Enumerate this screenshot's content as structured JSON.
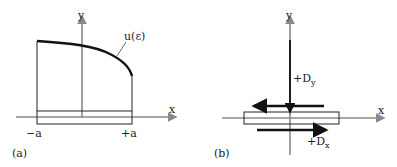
{
  "panel_a": {
    "caption": "(a)",
    "y_axis_label": "y",
    "x_axis_label": "x",
    "curve_label": "u(ε)",
    "left_label": "−a",
    "right_label": "+a"
  },
  "panel_b": {
    "caption": "(b)",
    "y_axis_label": "y",
    "x_axis_label": "x",
    "dy_label_prefix": "+D",
    "dy_label_sub": "y",
    "dx_label_prefix": "+D",
    "dx_label_sub": "x"
  },
  "colors": {
    "axis": "#8a8a8a",
    "line": "#222222",
    "curve": "#111111"
  }
}
